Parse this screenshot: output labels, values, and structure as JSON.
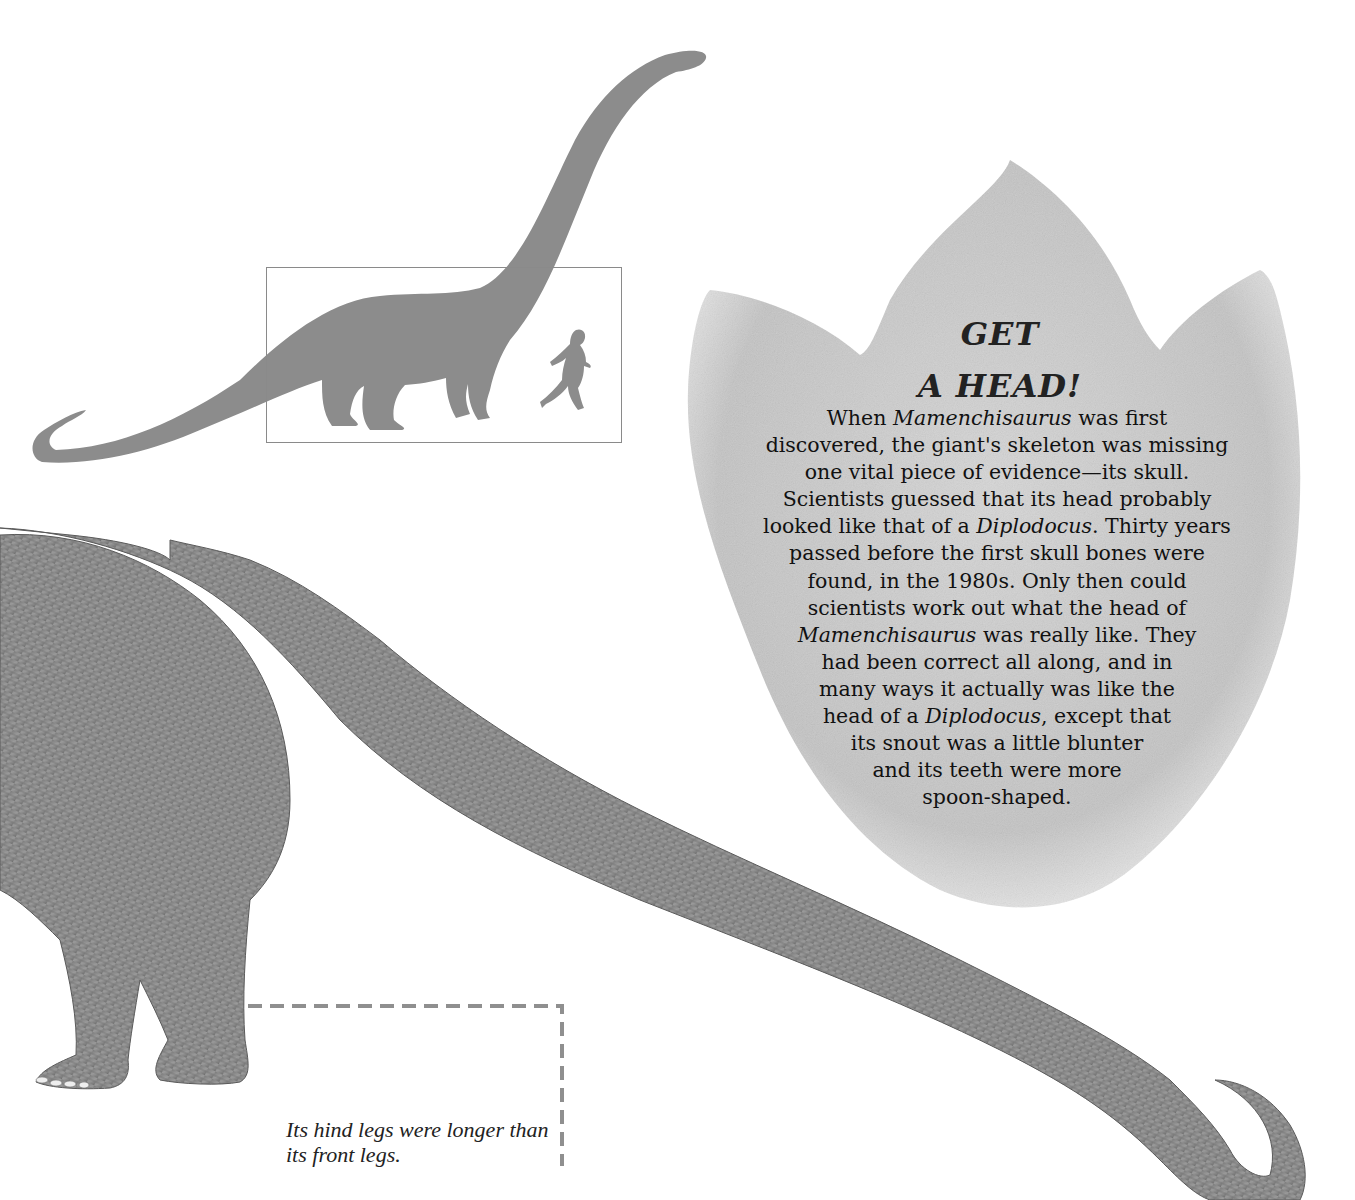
{
  "scale_diagram": {
    "subject": "dinosaur-silhouette",
    "comparison": "human-runner-silhouette",
    "silhouette_color": "#8c8c8c",
    "box_color": "#8a8a8a"
  },
  "sidebar_box": {
    "shape": "dinosaur-footprint",
    "heading_line_1": "GET",
    "heading_line_2": "A HEAD!",
    "body_lines": [
      {
        "parts": [
          {
            "t": "When "
          },
          {
            "t": "Mamenchisaurus",
            "i": true
          },
          {
            "t": " was first"
          }
        ]
      },
      {
        "parts": [
          {
            "t": "discovered, the giant's skeleton was missing"
          }
        ]
      },
      {
        "parts": [
          {
            "t": "one vital piece of evidence—its skull."
          }
        ]
      },
      {
        "parts": [
          {
            "t": "Scientists guessed that its head probably"
          }
        ]
      },
      {
        "parts": [
          {
            "t": "looked like that of a "
          },
          {
            "t": "Diplodocus",
            "i": true
          },
          {
            "t": ". Thirty years"
          }
        ]
      },
      {
        "parts": [
          {
            "t": "passed before the first skull bones were"
          }
        ]
      },
      {
        "parts": [
          {
            "t": "found, in the 1980s. Only then could"
          }
        ]
      },
      {
        "parts": [
          {
            "t": "scientists work out what the head of"
          }
        ]
      },
      {
        "parts": [
          {
            "t": "Mamenchisaurus",
            "i": true
          },
          {
            "t": " was really like. They"
          }
        ]
      },
      {
        "parts": [
          {
            "t": "had been correct all along, and in"
          }
        ]
      },
      {
        "parts": [
          {
            "t": "many ways it actually was like the"
          }
        ]
      },
      {
        "parts": [
          {
            "t": "head of a "
          },
          {
            "t": "Diplodocus",
            "i": true
          },
          {
            "t": ", except that"
          }
        ]
      },
      {
        "parts": [
          {
            "t": "its snout was a little blunter"
          }
        ]
      },
      {
        "parts": [
          {
            "t": "and its teeth were more"
          }
        ]
      },
      {
        "parts": [
          {
            "t": "spoon-shaped."
          }
        ]
      }
    ]
  },
  "illustration": {
    "subject": "mamenchisaurus-hind-body-and-tail",
    "caption": "Its hind legs were longer than its front legs.",
    "callout_color": "#8f8f8f"
  }
}
